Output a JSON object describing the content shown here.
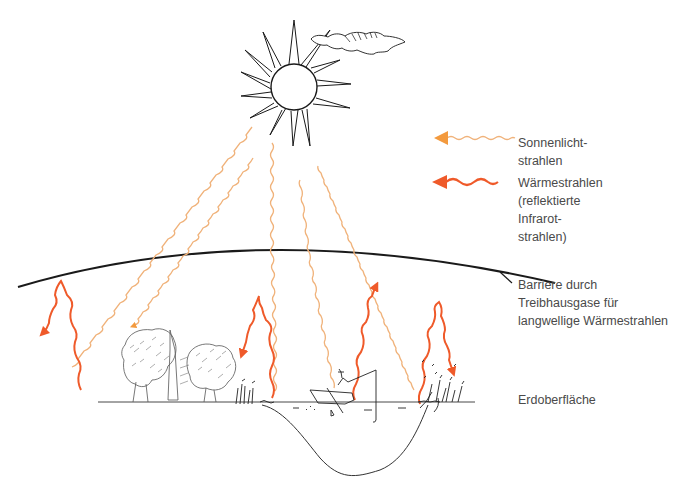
{
  "colors": {
    "sunlight": "#f0b27a",
    "sunlight_arrow": "#f39a3e",
    "heat": "#ef5a2a",
    "ink": "#1a1a1a",
    "text": "#4a4a4a",
    "background": "#ffffff"
  },
  "legend": {
    "sunlight": {
      "icon": "wavy-arrow-light-orange",
      "lines": [
        "Sonnenlicht-",
        "strahlen"
      ]
    },
    "heat": {
      "icon": "wavy-arrow-dark-orange",
      "lines": [
        "Wärmestrahlen",
        "(reflektierte",
        "Infrarot-",
        "strahlen)"
      ]
    }
  },
  "labels": {
    "barrier": [
      "Barriere durch",
      "Treibhausgase für",
      "langwellige Wärmestrahlen"
    ],
    "surface": [
      "Erdoberfläche"
    ]
  },
  "icons": {
    "sun": "sun-icon",
    "cloud": "cloud-icon",
    "trees": "trees-icon",
    "boat": "rowing-boat-icon",
    "reeds": "reeds-icon"
  }
}
